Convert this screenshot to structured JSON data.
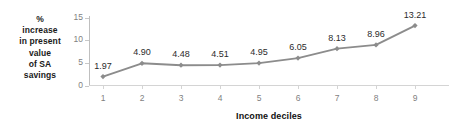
{
  "chart_data": {
    "type": "line",
    "title": "",
    "xlabel": "Income deciles",
    "ylabel": "% increase in present value of SA savings",
    "ylabel_lines": [
      "%",
      "increase",
      "in present",
      "value",
      "of SA",
      "savings"
    ],
    "categories": [
      "1",
      "2",
      "3",
      "4",
      "5",
      "6",
      "7",
      "8",
      "9"
    ],
    "values": [
      1.97,
      4.9,
      4.48,
      4.51,
      4.95,
      6.05,
      8.13,
      8.96,
      13.21
    ],
    "point_labels": [
      "1.97",
      "4.90",
      "4.48",
      "4.51",
      "4.95",
      "6.05",
      "8.13",
      "8.96",
      "13.21"
    ],
    "ylim": [
      0,
      15
    ],
    "y_ticks": [
      "0",
      "5",
      "10",
      "15"
    ],
    "y_tick_values": [
      0,
      5,
      10,
      15
    ],
    "grid": false,
    "legend": false,
    "series_color": "#8c8c8c",
    "marker": "diamond",
    "marker_color": "#8c8c8c",
    "axis_color": "#bfbfbf",
    "tick_label_color": "#7f7f7f",
    "data_label_color": "#2b2b2b",
    "background": "#ffffff"
  }
}
